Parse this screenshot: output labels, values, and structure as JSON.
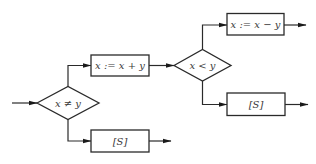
{
  "diagram": {
    "type": "flowchart",
    "nodes": {
      "cond1": {
        "label": "x ≠ y",
        "shape": "diamond"
      },
      "assign_add": {
        "label": "x := x + y",
        "shape": "box"
      },
      "s_lower": {
        "label": "[S]",
        "shape": "box"
      },
      "cond2": {
        "label": "x < y",
        "shape": "diamond"
      },
      "assign_sub": {
        "label": "x := x − y",
        "shape": "box"
      },
      "s_right": {
        "label": "[S]",
        "shape": "box"
      }
    },
    "edges": [
      {
        "from": "entry",
        "to": "cond1"
      },
      {
        "from": "cond1",
        "to": "assign_add",
        "branch": "upper"
      },
      {
        "from": "cond1",
        "to": "s_lower",
        "branch": "lower"
      },
      {
        "from": "assign_add",
        "to": "cond2"
      },
      {
        "from": "cond2",
        "to": "assign_sub",
        "branch": "upper"
      },
      {
        "from": "cond2",
        "to": "s_right",
        "branch": "lower"
      },
      {
        "from": "assign_sub",
        "to": "exit"
      },
      {
        "from": "s_right",
        "to": "exit"
      },
      {
        "from": "s_lower",
        "to": "exit"
      }
    ],
    "colors": {
      "stroke": "#2a2a2a",
      "text": "#3a3a3a",
      "background": "#ffffff"
    }
  }
}
